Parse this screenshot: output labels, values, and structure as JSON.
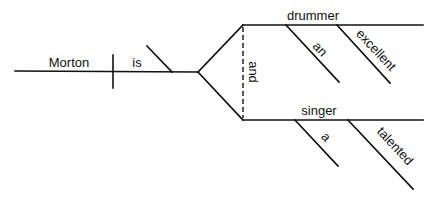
{
  "diagram": {
    "type": "sentence-diagram",
    "sentence": "Morton is an excellent drummer and a talented singer",
    "subject": "Morton",
    "verb": "is",
    "conjunction": "and",
    "complements": [
      {
        "word": "drummer",
        "modifiers": [
          "an",
          "excellent"
        ]
      },
      {
        "word": "singer",
        "modifiers": [
          "a",
          "talented"
        ]
      }
    ],
    "line_color": "#111111",
    "background": "#ffffff"
  }
}
